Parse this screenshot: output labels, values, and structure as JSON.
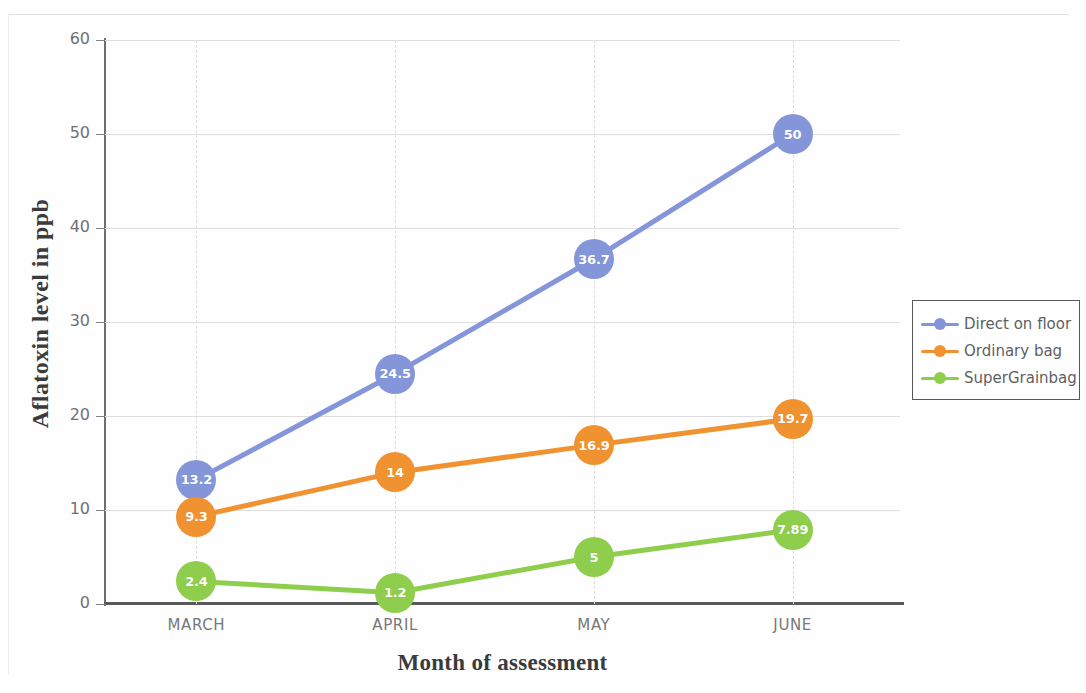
{
  "chart_data": {
    "type": "line",
    "title": "",
    "xlabel": "Month of assessment",
    "ylabel": "Aflatoxin level in ppb",
    "categories": [
      "MARCH",
      "APRIL",
      "MAY",
      "JUNE"
    ],
    "ylim": [
      0,
      60
    ],
    "yticks": [
      0,
      10,
      20,
      30,
      40,
      50,
      60
    ],
    "grid": true,
    "legend_position": "right",
    "series": [
      {
        "name": "Direct on floor",
        "color": "#8495d9",
        "values": [
          13.2,
          24.5,
          36.7,
          50
        ],
        "labels": [
          "13.2",
          "24.5",
          "36.7",
          "50"
        ]
      },
      {
        "name": "Ordinary bag",
        "color": "#f0922f",
        "values": [
          9.3,
          14,
          16.9,
          19.7
        ],
        "labels": [
          "9.3",
          "14",
          "16.9",
          "19.7"
        ]
      },
      {
        "name": "SuperGrainbag",
        "color": "#8ece4c",
        "values": [
          2.4,
          1.2,
          5,
          7.89
        ],
        "labels": [
          "2.4",
          "1.2",
          "5",
          "7.89"
        ]
      }
    ]
  },
  "axis": {
    "y_tick_labels": [
      "60",
      "50",
      "40",
      "30",
      "20",
      "10",
      "0"
    ],
    "y_title": "Aflatoxin level in ppb",
    "x_title": "Month of assessment",
    "x_tick_labels": [
      "MARCH",
      "APRIL",
      "MAY",
      "JUNE"
    ]
  },
  "legend": {
    "items": [
      {
        "label": "Direct on floor",
        "color": "#8495d9"
      },
      {
        "label": "Ordinary bag",
        "color": "#f0922f"
      },
      {
        "label": "SuperGrainbag",
        "color": "#8ece4c"
      }
    ]
  }
}
